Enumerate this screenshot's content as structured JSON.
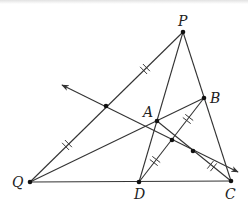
{
  "diagram": {
    "type": "geometry",
    "points": {
      "P": {
        "label": "P",
        "x": 183,
        "y": 32
      },
      "B": {
        "label": "B",
        "x": 204,
        "y": 98
      },
      "A": {
        "label": "A",
        "x": 157,
        "y": 121
      },
      "Q": {
        "label": "Q",
        "x": 30,
        "y": 182
      },
      "D": {
        "label": "D",
        "x": 139,
        "y": 182
      },
      "C": {
        "label": "C",
        "x": 231,
        "y": 181
      },
      "M": {
        "label": "",
        "x": 106,
        "y": 106
      },
      "E": {
        "label": "",
        "x": 172,
        "y": 140
      },
      "F": {
        "label": "",
        "x": 193,
        "y": 151
      }
    },
    "segments": [
      [
        "Q",
        "P"
      ],
      [
        "P",
        "D"
      ],
      [
        "P",
        "C"
      ],
      [
        "Q",
        "C"
      ],
      [
        "Q",
        "B"
      ],
      [
        "D",
        "B"
      ],
      [
        "A",
        "C"
      ]
    ],
    "ray": {
      "from": [
        62,
        85
      ],
      "to": [
        238,
        172
      ],
      "through": [
        "M",
        "E"
      ],
      "arrows": "both"
    },
    "equal_marks": "double ticks on QM, MP, DE, EB, FC",
    "stroke_color": "#333333"
  }
}
